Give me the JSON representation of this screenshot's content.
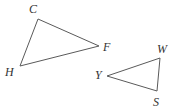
{
  "figure": {
    "background_color": "#ffffff",
    "stroke_color": "#5a5a5a",
    "label_color": "#333333",
    "stroke_width": 1
  },
  "triangles": [
    {
      "name": "triangle-CFH",
      "vertices": [
        {
          "label": "C",
          "x": 38,
          "y": 19,
          "label_x": 29,
          "label_y": 13
        },
        {
          "label": "F",
          "x": 99,
          "y": 46,
          "label_x": 103,
          "label_y": 51
        },
        {
          "label": "H",
          "x": 20,
          "y": 66,
          "label_x": 5,
          "label_y": 76
        }
      ],
      "path": "M 38 19 L 99 46 L 20 66 Z"
    },
    {
      "name": "triangle-WYS",
      "vertices": [
        {
          "label": "W",
          "x": 160,
          "y": 58,
          "label_x": 157,
          "label_y": 53
        },
        {
          "label": "Y",
          "x": 107,
          "y": 76,
          "label_x": 95,
          "label_y": 79
        },
        {
          "label": "S",
          "x": 157,
          "y": 91,
          "label_x": 153,
          "label_y": 106
        }
      ],
      "path": "M 160 58 L 107 76 L 157 91 Z"
    }
  ]
}
